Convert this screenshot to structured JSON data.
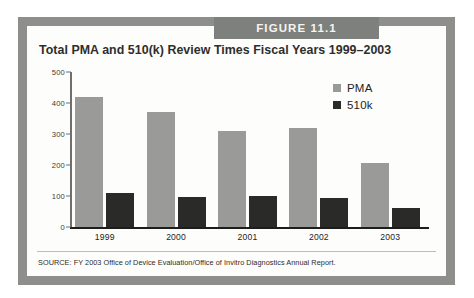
{
  "figure": {
    "band_label": "FIGURE 11.1",
    "band_color": "#7e807d",
    "frame_color": "#8e8f8c",
    "background_color": "#fdfdfc"
  },
  "source": {
    "text": "SOURCE: FY 2003 Office of Device Evaluation/Office of Invitro Diagnostics Annual Report."
  },
  "chart_data": {
    "type": "bar",
    "title": "Total PMA and 510(k) Review Times Fiscal Years 1999–2003",
    "xlabel": "",
    "ylabel": "",
    "ylim": [
      0,
      500
    ],
    "yticks": [
      0,
      100,
      200,
      300,
      400,
      500
    ],
    "ytick_labels": [
      "0",
      "100",
      "200",
      "300",
      "400",
      "500"
    ],
    "grid": false,
    "legend_position": "upper right",
    "categories": [
      "1999",
      "2000",
      "2001",
      "2002",
      "2003"
    ],
    "series": [
      {
        "name": "PMA",
        "color": "#9a9b98",
        "values": [
          420,
          370,
          310,
          320,
          205
        ]
      },
      {
        "name": "510k",
        "color": "#2a2a28",
        "values": [
          110,
          98,
          100,
          92,
          62
        ]
      }
    ]
  }
}
